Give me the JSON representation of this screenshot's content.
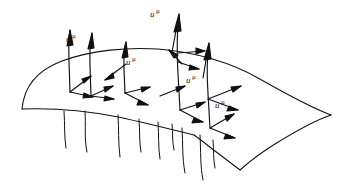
{
  "figure": {
    "ink_color": "#111111",
    "background_color": "#ffffff",
    "surface": {
      "name": "spacelike-hypersurface",
      "style": "hand-drawn curved sheet"
    },
    "labels": [
      {
        "id": "label-1",
        "base": "u",
        "superscript": "μ",
        "x": 66,
        "y": 33
      },
      {
        "id": "label-2",
        "base": "u",
        "superscript": "μ",
        "x": 150,
        "y": 8
      },
      {
        "id": "label-3",
        "base": "u",
        "superscript": "μ",
        "x": 126,
        "y": 56
      },
      {
        "id": "label-4",
        "base": "u",
        "superscript": "μ",
        "x": 186,
        "y": 74
      },
      {
        "id": "label-5",
        "base": "u",
        "superscript": "μ",
        "x": 215,
        "y": 99
      }
    ],
    "frames": [
      {
        "id": "frame-1",
        "base_x": 70,
        "base_y": 92
      },
      {
        "id": "frame-2",
        "base_x": 91,
        "base_y": 96
      },
      {
        "id": "frame-3",
        "base_x": 125,
        "base_y": 93
      },
      {
        "id": "frame-4",
        "base_x": 180,
        "base_y": 110
      },
      {
        "id": "frame-5",
        "base_x": 210,
        "base_y": 128
      }
    ],
    "worldline_count": 9
  }
}
